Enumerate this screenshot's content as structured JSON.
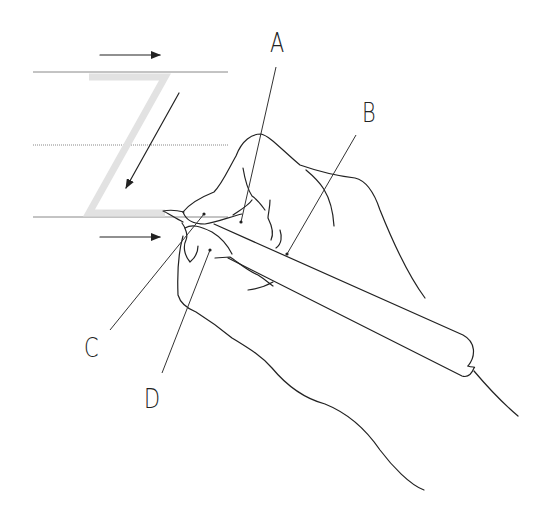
{
  "diagram": {
    "title": "",
    "traced_letter": "Z",
    "colors": {
      "line": "#222222",
      "guide_rule": "#888888",
      "ghost_letter": "#e2e2e2",
      "background": "#ffffff"
    },
    "labels": [
      {
        "id": "A",
        "text": "A",
        "x": 270,
        "y": 30
      },
      {
        "id": "B",
        "text": "B",
        "x": 362,
        "y": 100
      },
      {
        "id": "C",
        "text": "C",
        "x": 84,
        "y": 335
      },
      {
        "id": "D",
        "text": "D",
        "x": 144,
        "y": 386
      }
    ],
    "arrows": [
      {
        "name": "top-arrow-right",
        "direction": "right"
      },
      {
        "name": "diagonal-arrow-down-left",
        "direction": "down-left"
      },
      {
        "name": "bottom-arrow-right",
        "direction": "right"
      }
    ],
    "guide_lines": 3
  }
}
